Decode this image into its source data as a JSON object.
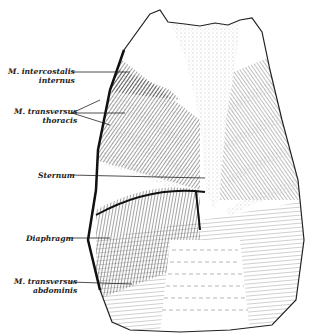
{
  "figure": {
    "colors": {
      "ink": "#222222",
      "stipple": "#9a9a9a",
      "paper": "#ffffff"
    },
    "labels": [
      {
        "id": "intercostalis",
        "line1": "M. intercostalis",
        "line2": "internus"
      },
      {
        "id": "transversus-thoracis",
        "line1": "M. transversus",
        "line2": "thoracis"
      },
      {
        "id": "sternum",
        "line1": "Sternum",
        "line2": ""
      },
      {
        "id": "diaphragm",
        "line1": "Diaphragm",
        "line2": ""
      },
      {
        "id": "transversus-abdominis",
        "line1": "M. transversus",
        "line2": "abdominis"
      }
    ]
  }
}
